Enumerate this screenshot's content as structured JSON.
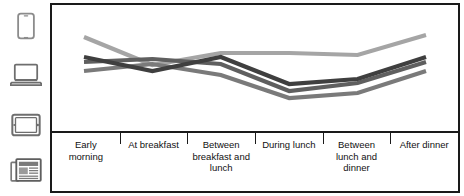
{
  "legend": {
    "title": "Device legend",
    "items": [
      {
        "id": "phone",
        "icon": "smartphone-icon",
        "label": "Smartphone"
      },
      {
        "id": "laptop",
        "icon": "laptop-icon",
        "label": "Laptop"
      },
      {
        "id": "tablet",
        "icon": "tablet-icon",
        "label": "Tablet"
      },
      {
        "id": "newspaper",
        "icon": "newspaper-icon",
        "label": "Newspaper"
      }
    ]
  },
  "chart_data": {
    "type": "line",
    "title": "",
    "subtitle": "",
    "xlabel": "",
    "ylabel": "",
    "grid": false,
    "legend_position": "left",
    "ylim": [
      0,
      100
    ],
    "categories": [
      "Early morning",
      "At breakfast",
      "Between breakfast and lunch",
      "During lunch",
      "Between lunch and dinner",
      "After dinner"
    ],
    "category_labels": [
      [
        "Early",
        "morning"
      ],
      [
        "At breakfast"
      ],
      [
        "Between",
        "breakfast and",
        "lunch"
      ],
      [
        "During lunch"
      ],
      [
        "Between",
        "lunch and",
        "dinner"
      ],
      [
        "After dinner"
      ]
    ],
    "series": [
      {
        "name": "Smartphone",
        "color": "#a5a5a5",
        "values": [
          82,
          54,
          66,
          66,
          64,
          84
        ]
      },
      {
        "name": "Laptop",
        "color": "#5f5f5f",
        "values": [
          57,
          60,
          55,
          28,
          36,
          57
        ]
      },
      {
        "name": "Tablet",
        "color": "#7a7a7a",
        "values": [
          48,
          55,
          44,
          21,
          26,
          48
        ]
      },
      {
        "name": "Newspaper",
        "color": "#3f3f3f",
        "values": [
          62,
          48,
          62,
          35,
          40,
          62
        ]
      }
    ]
  },
  "frame": {
    "border_color": "#1a1a1a",
    "background": "#ffffff"
  }
}
